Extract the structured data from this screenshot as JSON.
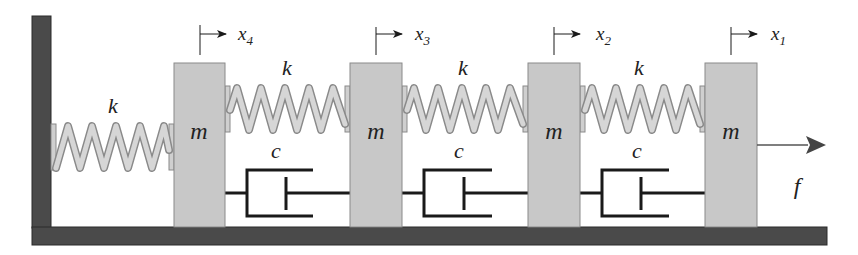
{
  "diagram": {
    "type": "mass-spring-damper chain",
    "colors": {
      "wall": "#4a4a4a",
      "ground": "#4a4a4a",
      "mass_fill": "#c8c8c8",
      "mass_stroke": "#8a8a8a",
      "spring_fill": "#cfcfcf",
      "spring_stroke": "#8a8a8a",
      "line": "#1a1a1a",
      "arrow": "#333333"
    },
    "masses": [
      {
        "label": "m",
        "displacement": "x",
        "sub": "4"
      },
      {
        "label": "m",
        "displacement": "x",
        "sub": "3"
      },
      {
        "label": "m",
        "displacement": "x",
        "sub": "2"
      },
      {
        "label": "m",
        "displacement": "x",
        "sub": "1"
      }
    ],
    "springs": [
      {
        "label": "k"
      },
      {
        "label": "k"
      },
      {
        "label": "k"
      },
      {
        "label": "k"
      }
    ],
    "dampers": [
      {
        "label": "c"
      },
      {
        "label": "c"
      },
      {
        "label": "c"
      }
    ],
    "force": {
      "label": "f"
    }
  }
}
